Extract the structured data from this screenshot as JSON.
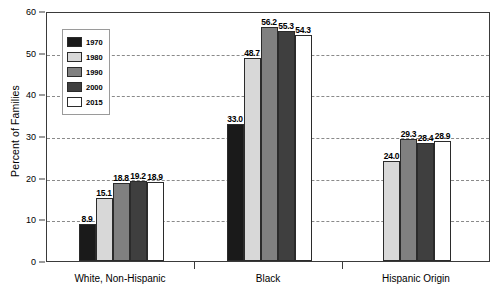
{
  "chart_data": {
    "type": "bar",
    "title": "",
    "xlabel": "",
    "ylabel": "Percent of Families",
    "ylim": [
      0,
      60
    ],
    "yticks": [
      0,
      10,
      20,
      30,
      40,
      50,
      60
    ],
    "grid": true,
    "legend_position": "upper-left-inside",
    "categories": [
      "White, Non-Hispanic",
      "Black",
      "Hispanic Origin"
    ],
    "series": [
      {
        "name": "1970",
        "color": "#1a1a1a",
        "values": [
          8.9,
          33.0,
          null
        ],
        "labels": [
          "8.9",
          "33.0",
          ""
        ]
      },
      {
        "name": "1980",
        "color": "#d8d8d8",
        "values": [
          15.1,
          48.7,
          24.0
        ],
        "labels": [
          "15.1",
          "48.7",
          "24.0"
        ]
      },
      {
        "name": "1990",
        "color": "#808080",
        "values": [
          18.8,
          56.2,
          29.3
        ],
        "labels": [
          "18.8",
          "56.2",
          "29.3"
        ]
      },
      {
        "name": "2000",
        "color": "#3f3f3f",
        "values": [
          19.2,
          55.3,
          28.4
        ],
        "labels": [
          "19.2",
          "55.3",
          "28.4"
        ]
      },
      {
        "name": "2015",
        "color": "#ffffff",
        "values": [
          18.9,
          54.3,
          28.9
        ],
        "labels": [
          "18.9",
          "54.3",
          "28.9"
        ]
      }
    ]
  },
  "legend": {
    "items": [
      {
        "label": "1970",
        "color": "#1a1a1a"
      },
      {
        "label": "1980",
        "color": "#d8d8d8"
      },
      {
        "label": "1990",
        "color": "#808080"
      },
      {
        "label": "2000",
        "color": "#3f3f3f"
      },
      {
        "label": "2015",
        "color": "#ffffff"
      }
    ]
  },
  "colors": {
    "axis": "#3a3a3a",
    "gridline": "#8a8a8a",
    "bar_outline": "#2b2b2b",
    "background": "#ffffff",
    "text": "#000000"
  }
}
